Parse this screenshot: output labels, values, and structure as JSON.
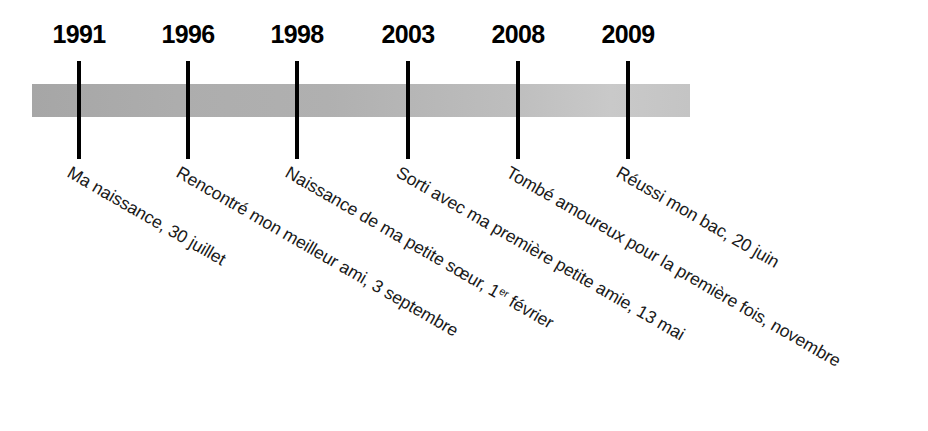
{
  "figure": {
    "type": "timeline",
    "orientation": "horizontal",
    "band_color_left": "#a6a6a6",
    "band_color_right": "#c9c9c9",
    "tick_color": "#000000",
    "caption_rotation_degrees": 30
  },
  "events": [
    {
      "year": "1991",
      "caption_prefix": "Ma naissance, 30 juillet",
      "caption_sup": "",
      "caption_suffix": ""
    },
    {
      "year": "1996",
      "caption_prefix": "Rencontré mon meilleur ami, 3 septembre",
      "caption_sup": "",
      "caption_suffix": ""
    },
    {
      "year": "1998",
      "caption_prefix": "Naissance de ma petite sœur, 1",
      "caption_sup": "er",
      "caption_suffix": " février"
    },
    {
      "year": "2003",
      "caption_prefix": "Sorti avec ma première petite amie, 13 mai",
      "caption_sup": "",
      "caption_suffix": ""
    },
    {
      "year": "2008",
      "caption_prefix": "Tombé amoureux pour la première fois, novembre",
      "caption_sup": "",
      "caption_suffix": ""
    },
    {
      "year": "2009",
      "caption_prefix": "Réussi mon bac, 20 juin",
      "caption_sup": "",
      "caption_suffix": ""
    }
  ],
  "positions": {
    "tick_x": [
      79,
      188,
      297,
      408,
      518,
      628
    ]
  }
}
